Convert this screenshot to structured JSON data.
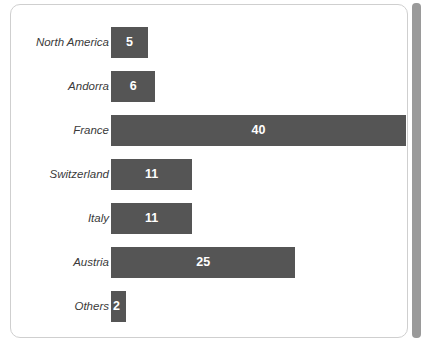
{
  "chart_data": {
    "type": "bar",
    "orientation": "horizontal",
    "title": "",
    "subtitle": "",
    "xlabel": "",
    "ylabel": "",
    "grid": false,
    "legend": false,
    "xlim": [
      0,
      40
    ],
    "bar_color": "#555555",
    "value_label_color": "#ffffff",
    "categories": [
      "North America",
      "Andorra",
      "France",
      "Switzerland",
      "Italy",
      "Austria",
      "Others"
    ],
    "values": [
      5,
      6,
      40,
      11,
      11,
      25,
      2
    ],
    "value_labels": [
      "5",
      "6",
      "40",
      "11",
      "11",
      "25",
      "2"
    ]
  },
  "scrollbar": {
    "name": "vertical-scrollbar",
    "position": "right"
  }
}
